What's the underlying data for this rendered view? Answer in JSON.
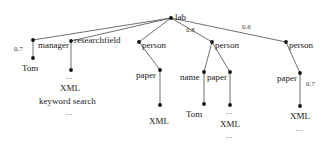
{
  "figure": {
    "type": "tree-diagram"
  },
  "nodes": {
    "root": {
      "label": "lab",
      "x": 171,
      "y": 18
    },
    "manager": {
      "label": "manager",
      "x": 33,
      "y": 40
    },
    "manager_child": {
      "label": "Tom",
      "x": 33,
      "y": 58
    },
    "researchfield": {
      "label": "researchfield",
      "x": 71,
      "y": 41
    },
    "researchfield_child": {
      "label": "",
      "x": 71,
      "y": 70
    },
    "person1": {
      "label": "person",
      "x": 139,
      "y": 42
    },
    "person1_paper": {
      "label": "paper",
      "x": 160,
      "y": 70
    },
    "person1_paper_child": {
      "label": "",
      "x": 160,
      "y": 105
    },
    "person2": {
      "label": "person",
      "x": 212,
      "y": 42
    },
    "person2_name": {
      "label": "name",
      "x": 204,
      "y": 72
    },
    "person2_name_child": {
      "label": "",
      "x": 204,
      "y": 104
    },
    "person2_paper": {
      "label": "paper",
      "x": 230,
      "y": 72
    },
    "person2_paper_child": {
      "label": "",
      "x": 230,
      "y": 105
    },
    "person3": {
      "label": "person",
      "x": 286,
      "y": 42
    },
    "person3_paper": {
      "label": "paper",
      "x": 300,
      "y": 73
    },
    "person3_paper_child": {
      "label": "",
      "x": 300,
      "y": 106
    }
  },
  "edges": [
    {
      "id": "lab-manager",
      "from": "root",
      "to": "manager",
      "weight": ""
    },
    {
      "id": "lab-researchfield",
      "from": "root",
      "to": "researchfield",
      "weight": ""
    },
    {
      "id": "lab-person1",
      "from": "root",
      "to": "person1",
      "weight": ""
    },
    {
      "id": "lab-person2",
      "from": "root",
      "to": "person2",
      "weight": "0.8"
    },
    {
      "id": "lab-person3",
      "from": "root",
      "to": "person3",
      "weight": "0.6"
    },
    {
      "id": "manager-tom",
      "from": "manager",
      "to": "manager_child",
      "weight": "0.7"
    },
    {
      "id": "researchfield-child",
      "from": "researchfield",
      "to": "researchfield_child",
      "weight": ""
    },
    {
      "id": "person1-paper",
      "from": "person1",
      "to": "person1_paper",
      "weight": ""
    },
    {
      "id": "paper1-child",
      "from": "person1_paper",
      "to": "person1_paper_child",
      "weight": ""
    },
    {
      "id": "person2-name",
      "from": "person2",
      "to": "person2_name",
      "weight": ""
    },
    {
      "id": "person2-paper",
      "from": "person2",
      "to": "person2_paper",
      "weight": ""
    },
    {
      "id": "name-child",
      "from": "person2_name",
      "to": "person2_name_child",
      "weight": ""
    },
    {
      "id": "paper2-child",
      "from": "person2_paper",
      "to": "person2_paper_child",
      "weight": ""
    },
    {
      "id": "person3-paper",
      "from": "person3",
      "to": "person3_paper",
      "weight": ""
    },
    {
      "id": "paper3-child",
      "from": "person3_paper",
      "to": "person3_paper_child",
      "weight": "0.7"
    }
  ],
  "edge_labels": {
    "lab_person2": "0.8",
    "lab_person3": "0.6",
    "manager_tom": "0.7",
    "paper3_child": "0.7"
  },
  "node_labels": {
    "root": "lab",
    "manager": "manager",
    "researchfield": "researchfield",
    "person1": "person",
    "person2": "person",
    "person3": "person",
    "paper1": "paper",
    "name2": "name",
    "paper2": "paper",
    "paper3": "paper"
  },
  "leaf_labels": {
    "tom_left": "Tom",
    "xml_researchfield": "XML",
    "keyword_search": "keyword search",
    "xml_paper1": "XML",
    "tom_name2": "Tom",
    "xml_paper2": "XML",
    "xml_paper3": "XML"
  },
  "ellipses": {
    "researchfield_dots": "...",
    "researchfield_tail": "...",
    "name2_dots": "...",
    "paper2_dots": "...",
    "paper2_tail": "...",
    "paper3_dots": "...",
    "paper3_tail": "..."
  },
  "colors": {
    "edge": "#4a4a4a",
    "node": "#111111",
    "text": "#1a1a1a",
    "background": "#ffffff"
  }
}
